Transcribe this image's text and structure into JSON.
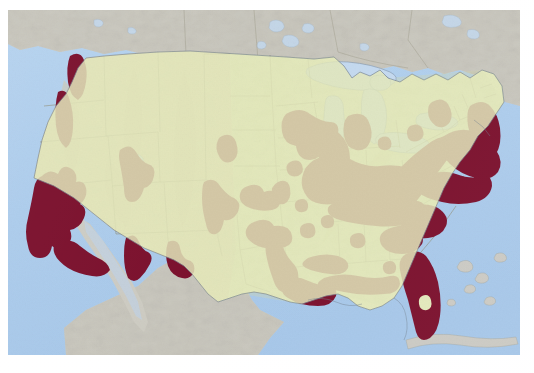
{
  "figure": {
    "kind": "species-distribution-map",
    "title": "",
    "caption": "",
    "region": "Continental United States",
    "projection": "Albers-like conic",
    "scan_background": "#ffffff"
  },
  "palette": {
    "ocean": "#aecdec",
    "ocean_deep": "#a9c9ea",
    "us_lowland_east": "#e3e8bb",
    "us_terrain_west": "#e8ddc0",
    "us_terrain_high": "#ded0ae",
    "canada_mexico": "#cdcbc2",
    "range_fill": "#7a0f2c",
    "range_fill_dark": "#6d0c26",
    "border_line": "#8d8a72",
    "coast_line": "#6f7c8c",
    "lake_fill": "#c3d9ef"
  },
  "legend": {
    "present_label": "",
    "absent_label": "",
    "visible": false
  },
  "landmasses": [
    {
      "name": "united-states",
      "label": ""
    },
    {
      "name": "canada",
      "label": ""
    },
    {
      "name": "mexico",
      "label": ""
    },
    {
      "name": "cuba-bahamas",
      "label": ""
    }
  ],
  "water_bodies": [
    {
      "name": "pacific-ocean",
      "label": ""
    },
    {
      "name": "atlantic-ocean",
      "label": ""
    },
    {
      "name": "gulf-of-mexico",
      "label": ""
    },
    {
      "name": "great-lakes",
      "label": ""
    },
    {
      "name": "great-salt-lake",
      "label": ""
    }
  ],
  "range_regions": [
    {
      "name": "puget-sound-washington",
      "intensity": "present"
    },
    {
      "name": "willamette-valley-oregon",
      "intensity": "present"
    },
    {
      "name": "coastal-california",
      "intensity": "present"
    },
    {
      "name": "southern-california",
      "intensity": "present"
    },
    {
      "name": "central-idaho",
      "intensity": "present"
    },
    {
      "name": "central-arizona",
      "intensity": "present"
    },
    {
      "name": "southern-arizona-newmexico",
      "intensity": "present"
    },
    {
      "name": "front-range-colorado",
      "intensity": "present"
    },
    {
      "name": "black-hills-south-dakota",
      "intensity": "present"
    },
    {
      "name": "nebraska-platte",
      "intensity": "present"
    },
    {
      "name": "kansas-flinthills",
      "intensity": "present"
    },
    {
      "name": "oklahoma-ozarks",
      "intensity": "present"
    },
    {
      "name": "central-texas",
      "intensity": "present"
    },
    {
      "name": "texas-gulf-coast",
      "intensity": "present"
    },
    {
      "name": "louisiana-gulf-coast",
      "intensity": "present"
    },
    {
      "name": "mississippi-alabama",
      "intensity": "present"
    },
    {
      "name": "minnesota-wisconsin",
      "intensity": "present"
    },
    {
      "name": "upper-michigan",
      "intensity": "present"
    },
    {
      "name": "lower-michigan",
      "intensity": "present"
    },
    {
      "name": "illinois-indiana-ohio",
      "intensity": "present"
    },
    {
      "name": "kentucky-tennessee",
      "intensity": "present"
    },
    {
      "name": "appalachian-corridor",
      "intensity": "present"
    },
    {
      "name": "mid-atlantic-piedmont",
      "intensity": "present"
    },
    {
      "name": "northeast-megalopolis",
      "intensity": "present"
    },
    {
      "name": "new-england-coast",
      "intensity": "present"
    },
    {
      "name": "adirondack-vermont",
      "intensity": "present"
    },
    {
      "name": "carolinas-piedmont",
      "intensity": "present"
    },
    {
      "name": "georgia-piedmont",
      "intensity": "present"
    },
    {
      "name": "florida-peninsula",
      "intensity": "present"
    }
  ]
}
